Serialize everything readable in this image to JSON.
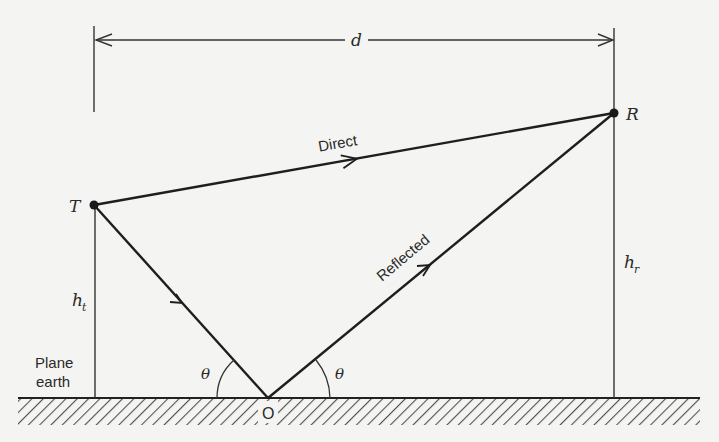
{
  "diagram": {
    "colors": {
      "background": "#f4f4f2",
      "ink": "#222222"
    },
    "labels": {
      "distance": "d",
      "transmitter": "T",
      "receiver": "R",
      "direct_path": "Direct",
      "reflected_path": "Reflected",
      "tx_height": "h",
      "tx_height_sub": "t",
      "rx_height": "h",
      "rx_height_sub": "r",
      "ground_line1": "Plane",
      "ground_line2": "earth",
      "reflection_point": "O",
      "angle_left": "θ",
      "angle_right": "θ"
    },
    "nodes": [
      {
        "id": "T",
        "role": "transmitter"
      },
      {
        "id": "R",
        "role": "receiver"
      },
      {
        "id": "O",
        "role": "reflection point"
      }
    ],
    "edges": [
      {
        "from": "T",
        "to": "R",
        "label": "Direct",
        "arrow": "forward"
      },
      {
        "from": "T",
        "to": "O",
        "label": "",
        "arrow": "forward"
      },
      {
        "from": "O",
        "to": "R",
        "label": "Reflected",
        "arrow": "forward"
      }
    ]
  }
}
